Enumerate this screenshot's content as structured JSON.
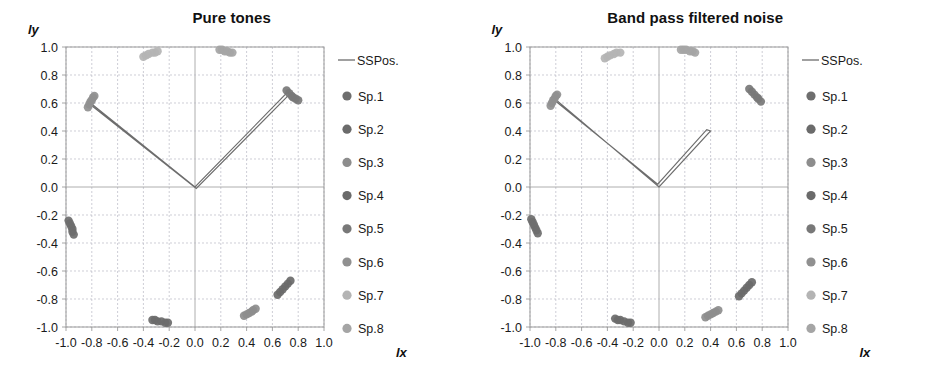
{
  "figure": {
    "axis_labels": {
      "x": "lx",
      "y": "ly"
    }
  },
  "chart_data": [
    {
      "type": "scatter",
      "title": "Pure tones",
      "xlabel": "lx",
      "ylabel": "ly",
      "xlim": [
        -1.0,
        1.0
      ],
      "ylim": [
        -1.0,
        1.0
      ],
      "xticks": [
        "-1.0",
        "-0.8",
        "-0.6",
        "-0.4",
        "-0.2",
        "0.0",
        "0.2",
        "0.4",
        "0.6",
        "0.8",
        "1.0"
      ],
      "yticks": [
        "1.0",
        "0.8",
        "0.6",
        "0.4",
        "0.2",
        "0.0",
        "-0.2",
        "-0.4",
        "-0.6",
        "-0.8",
        "-1.0"
      ],
      "grid": true,
      "legend_position": "right",
      "series": [
        {
          "name": "Sp.1",
          "color": "#6e6e6e",
          "points": [
            [
              -0.98,
              -0.24
            ],
            [
              -0.97,
              -0.26
            ],
            [
              -0.96,
              -0.28
            ],
            [
              -0.95,
              -0.3
            ],
            [
              -0.95,
              -0.32
            ],
            [
              -0.94,
              -0.34
            ]
          ]
        },
        {
          "name": "Sp.2",
          "color": "#6b6b6b",
          "points": [
            [
              -0.33,
              -0.95
            ],
            [
              -0.31,
              -0.95
            ],
            [
              -0.29,
              -0.96
            ],
            [
              -0.26,
              -0.96
            ],
            [
              -0.23,
              -0.97
            ],
            [
              -0.21,
              -0.97
            ]
          ]
        },
        {
          "name": "Sp.3",
          "color": "#8d8d8d",
          "points": [
            [
              0.38,
              -0.92
            ],
            [
              0.4,
              -0.91
            ],
            [
              0.42,
              -0.9
            ],
            [
              0.44,
              -0.89
            ],
            [
              0.45,
              -0.88
            ],
            [
              0.47,
              -0.87
            ]
          ]
        },
        {
          "name": "Sp.4",
          "color": "#6a6a6a",
          "points": [
            [
              0.64,
              -0.77
            ],
            [
              0.66,
              -0.75
            ],
            [
              0.68,
              -0.73
            ],
            [
              0.7,
              -0.71
            ],
            [
              0.72,
              -0.69
            ],
            [
              0.74,
              -0.67
            ]
          ]
        },
        {
          "name": "Sp.5",
          "color": "#787878",
          "points": [
            [
              0.71,
              0.69
            ],
            [
              0.73,
              0.67
            ],
            [
              0.75,
              0.65
            ],
            [
              0.76,
              0.64
            ],
            [
              0.78,
              0.63
            ],
            [
              0.8,
              0.62
            ]
          ]
        },
        {
          "name": "Sp.6",
          "color": "#909090",
          "points": [
            [
              -0.83,
              0.57
            ],
            [
              -0.82,
              0.59
            ],
            [
              -0.81,
              0.61
            ],
            [
              -0.8,
              0.62
            ],
            [
              -0.79,
              0.64
            ],
            [
              -0.78,
              0.65
            ]
          ]
        },
        {
          "name": "Sp.7",
          "color": "#b4b4b4",
          "points": [
            [
              -0.4,
              0.93
            ],
            [
              -0.38,
              0.94
            ],
            [
              -0.36,
              0.95
            ],
            [
              -0.33,
              0.96
            ],
            [
              -0.31,
              0.96
            ],
            [
              -0.29,
              0.97
            ]
          ]
        },
        {
          "name": "Sp.8",
          "color": "#a5a5a5",
          "points": [
            [
              0.19,
              0.98
            ],
            [
              0.21,
              0.98
            ],
            [
              0.23,
              0.97
            ],
            [
              0.25,
              0.97
            ],
            [
              0.27,
              0.96
            ],
            [
              0.29,
              0.96
            ]
          ]
        }
      ],
      "ssposition_line": {
        "name": "SSPos.",
        "color": "#6d6d6d",
        "path": [
          [
            -0.81,
            0.6
          ],
          [
            0.0,
            0.0
          ],
          [
            0.72,
            0.68
          ],
          [
            0.73,
            0.66
          ],
          [
            0.01,
            -0.01
          ],
          [
            -0.8,
            0.58
          ]
        ]
      }
    },
    {
      "type": "scatter",
      "title": "Band pass filtered noise",
      "xlabel": "lx",
      "ylabel": "ly",
      "xlim": [
        -1.0,
        1.0
      ],
      "ylim": [
        -1.0,
        1.0
      ],
      "xticks": [
        "-1.0",
        "-0.8",
        "-0.6",
        "-0.4",
        "-0.2",
        "0.0",
        "0.2",
        "0.4",
        "0.6",
        "0.8",
        "1.0"
      ],
      "yticks": [
        "1.0",
        "0.8",
        "0.6",
        "0.4",
        "0.2",
        "0.0",
        "-0.2",
        "-0.4",
        "-0.6",
        "-0.8",
        "-1.0"
      ],
      "grid": true,
      "legend_position": "right",
      "series": [
        {
          "name": "Sp.1",
          "color": "#6e6e6e",
          "points": [
            [
              -0.99,
              -0.23
            ],
            [
              -0.98,
              -0.25
            ],
            [
              -0.97,
              -0.27
            ],
            [
              -0.96,
              -0.29
            ],
            [
              -0.95,
              -0.31
            ],
            [
              -0.94,
              -0.33
            ]
          ]
        },
        {
          "name": "Sp.2",
          "color": "#6b6b6b",
          "points": [
            [
              -0.34,
              -0.94
            ],
            [
              -0.32,
              -0.95
            ],
            [
              -0.3,
              -0.95
            ],
            [
              -0.27,
              -0.96
            ],
            [
              -0.24,
              -0.97
            ],
            [
              -0.22,
              -0.97
            ]
          ]
        },
        {
          "name": "Sp.3",
          "color": "#8d8d8d",
          "points": [
            [
              0.36,
              -0.93
            ],
            [
              0.38,
              -0.92
            ],
            [
              0.4,
              -0.91
            ],
            [
              0.42,
              -0.9
            ],
            [
              0.44,
              -0.89
            ],
            [
              0.46,
              -0.88
            ]
          ]
        },
        {
          "name": "Sp.4",
          "color": "#6a6a6a",
          "points": [
            [
              0.62,
              -0.78
            ],
            [
              0.64,
              -0.76
            ],
            [
              0.66,
              -0.74
            ],
            [
              0.68,
              -0.72
            ],
            [
              0.7,
              -0.7
            ],
            [
              0.72,
              -0.68
            ]
          ]
        },
        {
          "name": "Sp.5",
          "color": "#787878",
          "points": [
            [
              0.7,
              0.7
            ],
            [
              0.72,
              0.68
            ],
            [
              0.74,
              0.66
            ],
            [
              0.76,
              0.64
            ],
            [
              0.77,
              0.63
            ],
            [
              0.79,
              0.61
            ]
          ]
        },
        {
          "name": "Sp.6",
          "color": "#909090",
          "points": [
            [
              -0.84,
              0.58
            ],
            [
              -0.83,
              0.6
            ],
            [
              -0.82,
              0.62
            ],
            [
              -0.81,
              0.63
            ],
            [
              -0.8,
              0.65
            ],
            [
              -0.79,
              0.66
            ]
          ]
        },
        {
          "name": "Sp.7",
          "color": "#b4b4b4",
          "points": [
            [
              -0.42,
              0.92
            ],
            [
              -0.4,
              0.93
            ],
            [
              -0.38,
              0.94
            ],
            [
              -0.35,
              0.95
            ],
            [
              -0.33,
              0.96
            ],
            [
              -0.3,
              0.96
            ]
          ]
        },
        {
          "name": "Sp.8",
          "color": "#a5a5a5",
          "points": [
            [
              0.17,
              0.98
            ],
            [
              0.19,
              0.98
            ],
            [
              0.21,
              0.98
            ],
            [
              0.24,
              0.97
            ],
            [
              0.26,
              0.97
            ],
            [
              0.28,
              0.96
            ]
          ]
        }
      ],
      "ssposition_line": {
        "name": "SSPos.",
        "color": "#6d6d6d",
        "path": [
          [
            -0.82,
            0.64
          ],
          [
            0.0,
            0.0
          ],
          [
            0.4,
            0.4
          ],
          [
            0.37,
            0.41
          ],
          [
            -0.01,
            0.02
          ],
          [
            -0.81,
            0.62
          ]
        ]
      }
    }
  ],
  "legend": {
    "line_entry": {
      "label": "SSPos.",
      "color": "#6d6d6d"
    },
    "items": [
      {
        "label": "Sp.1",
        "color": "#6e6e6e"
      },
      {
        "label": "Sp.2",
        "color": "#6b6b6b"
      },
      {
        "label": "Sp.3",
        "color": "#8d8d8d"
      },
      {
        "label": "Sp.4",
        "color": "#6a6a6a"
      },
      {
        "label": "Sp.5",
        "color": "#787878"
      },
      {
        "label": "Sp.6",
        "color": "#909090"
      },
      {
        "label": "Sp.7",
        "color": "#b4b4b4"
      },
      {
        "label": "Sp.8",
        "color": "#a5a5a5"
      }
    ]
  }
}
